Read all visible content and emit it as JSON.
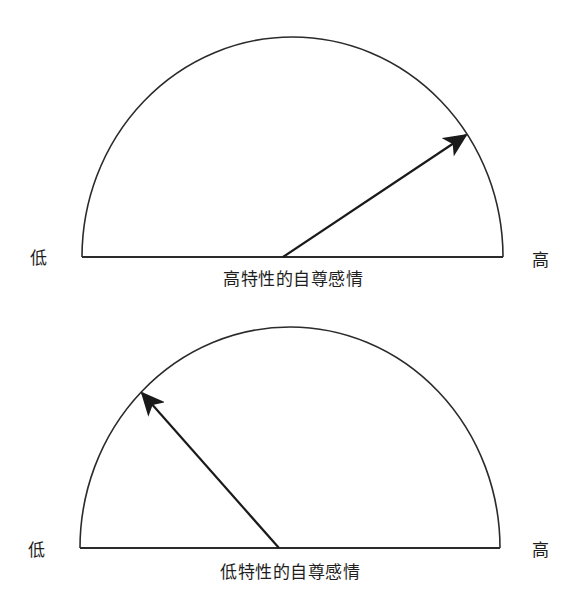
{
  "gauges": [
    {
      "id": "high-trait-self-esteem",
      "caption": "高特性的自尊感情",
      "low_label": "低",
      "high_label": "高",
      "needle_position": "high",
      "needle_angle_deg_from_left": 146,
      "geometry": {
        "center_x": 283,
        "baseline_y": 257,
        "left_x": 82,
        "right_x": 503,
        "top_y": 37,
        "needle_tip_x": 466,
        "needle_tip_y": 135
      }
    },
    {
      "id": "low-trait-self-esteem",
      "caption": "低特性的自尊感情",
      "low_label": "低",
      "high_label": "高",
      "needle_position": "low",
      "needle_angle_deg_from_left": 49,
      "geometry": {
        "center_x": 279,
        "baseline_y": 548,
        "left_x": 80,
        "right_x": 500,
        "top_y": 327,
        "needle_tip_x": 142,
        "needle_tip_y": 393
      }
    }
  ],
  "colors": {
    "stroke": "#2b2b2b",
    "needle": "#1a1a1a",
    "background": "#ffffff"
  }
}
